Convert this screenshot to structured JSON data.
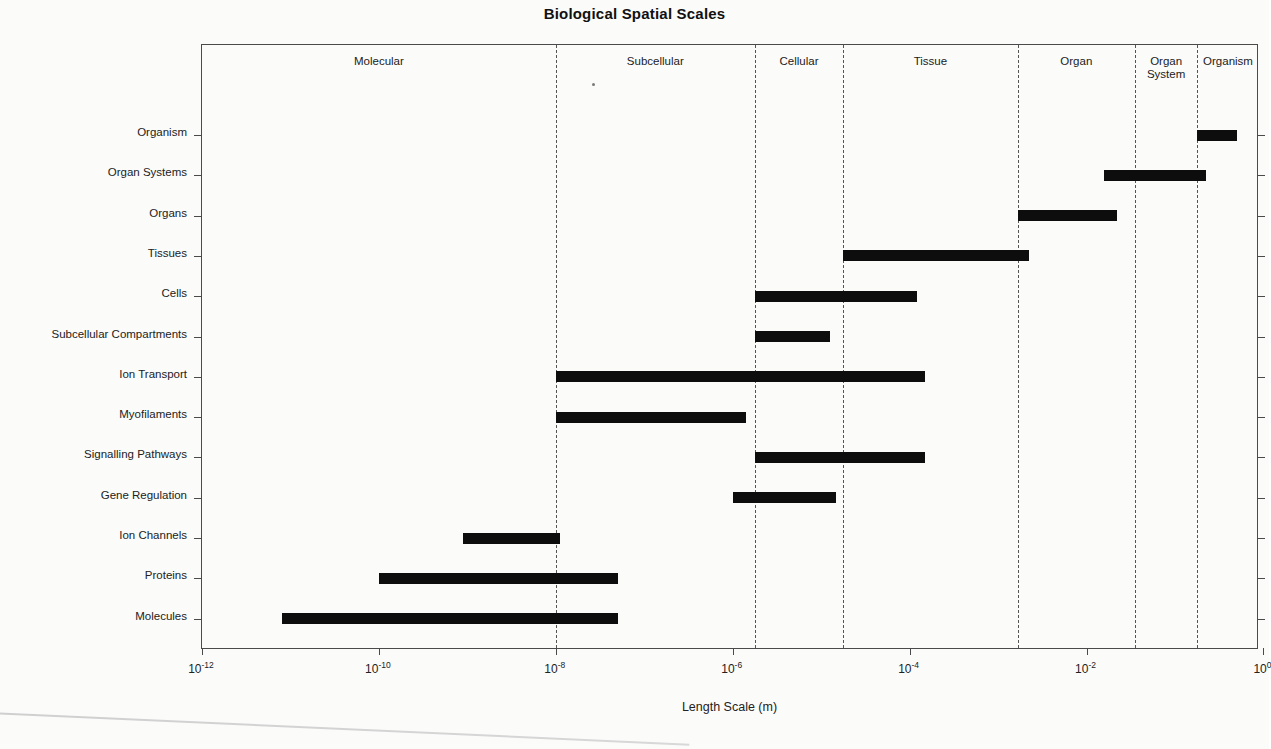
{
  "chart": {
    "title": "Biological Spatial Scales",
    "xaxis_title": "Length Scale (m)"
  },
  "chart_data": {
    "type": "bar",
    "orientation": "horizontal",
    "title": "Biological Spatial Scales",
    "xlabel": "Length Scale (m)",
    "ylabel": "",
    "xscale": "log10",
    "xlim": [
      -12.0,
      -0.05
    ],
    "grid": false,
    "legend": null,
    "xticks": [
      {
        "label": "10⁻¹²",
        "base": "10",
        "exp": "-12",
        "value": -12
      },
      {
        "label": "10⁻¹⁰",
        "base": "10",
        "exp": "-10",
        "value": -10
      },
      {
        "label": "10⁻⁸",
        "base": "10",
        "exp": "-8",
        "value": -8
      },
      {
        "label": "10⁻⁶",
        "base": "10",
        "exp": "-6",
        "value": -6
      },
      {
        "label": "10⁻⁴",
        "base": "10",
        "exp": "-4",
        "value": -4
      },
      {
        "label": "10⁻²",
        "base": "10",
        "exp": "-2",
        "value": -2
      },
      {
        "label": "10⁰",
        "base": "10",
        "exp": "0",
        "value": 0
      }
    ],
    "categories": [
      "Molecules",
      "Proteins",
      "Ion Channels",
      "Gene Regulation",
      "Signalling Pathways",
      "Myofilaments",
      "Ion Transport",
      "Subcellular Compartments",
      "Cells",
      "Tissues",
      "Organs",
      "Organ Systems",
      "Organism"
    ],
    "bars": [
      {
        "label": "Organism",
        "start_log10": -0.75,
        "end_log10": -0.3
      },
      {
        "label": "Organ Systems",
        "start_log10": -1.8,
        "end_log10": -0.65
      },
      {
        "label": "Organs",
        "start_log10": -2.78,
        "end_log10": -1.65
      },
      {
        "label": "Tissues",
        "start_log10": -4.75,
        "end_log10": -2.65
      },
      {
        "label": "Cells",
        "start_log10": -5.75,
        "end_log10": -3.92
      },
      {
        "label": "Subcellular Compartments",
        "start_log10": -5.75,
        "end_log10": -4.9
      },
      {
        "label": "Ion Transport",
        "start_log10": -8.0,
        "end_log10": -3.83
      },
      {
        "label": "Myofilaments",
        "start_log10": -8.0,
        "end_log10": -5.85
      },
      {
        "label": "Signalling Pathways",
        "start_log10": -5.75,
        "end_log10": -3.83
      },
      {
        "label": "Gene Regulation",
        "start_log10": -6.0,
        "end_log10": -4.83
      },
      {
        "label": "Ion Channels",
        "start_log10": -9.05,
        "end_log10": -7.95
      },
      {
        "label": "Proteins",
        "start_log10": -10.0,
        "end_log10": -7.3
      },
      {
        "label": "Molecules",
        "start_log10": -11.1,
        "end_log10": -7.3
      }
    ],
    "regions": [
      {
        "label": "Molecular",
        "start_log10": -12.0,
        "end_log10": -8.0
      },
      {
        "label": "Subcellular",
        "start_log10": -8.0,
        "end_log10": -5.75
      },
      {
        "label": "Cellular",
        "start_log10": -5.75,
        "end_log10": -4.75
      },
      {
        "label": "Tissue",
        "start_log10": -4.75,
        "end_log10": -2.78
      },
      {
        "label": "Organ",
        "start_log10": -2.78,
        "end_log10": -1.45
      },
      {
        "label": "Organ\nSystem",
        "start_log10": -1.45,
        "end_log10": -0.75
      },
      {
        "label": "Organism",
        "start_log10": -0.75,
        "end_log10": -0.05
      }
    ],
    "region_dividers_log10": [
      -8.0,
      -5.75,
      -4.75,
      -2.78,
      -1.45,
      -0.75
    ],
    "bar_color": "#0d0d0d",
    "axis_color": "#4a4a4a"
  }
}
